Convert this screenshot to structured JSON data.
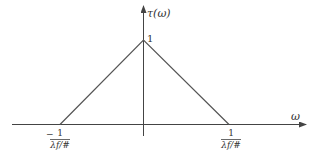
{
  "diagram": {
    "type": "triangle-function-plot",
    "y_axis_label": "τ(ω)",
    "x_axis_label": "ω",
    "peak_label": "1",
    "left_tick": {
      "sign": "−",
      "numerator": "1",
      "denominator": "λf/#"
    },
    "right_tick": {
      "numerator": "1",
      "denominator": "λf/#"
    },
    "colors": {
      "line": "#555555",
      "axis": "#444444",
      "text": "#333333"
    }
  }
}
